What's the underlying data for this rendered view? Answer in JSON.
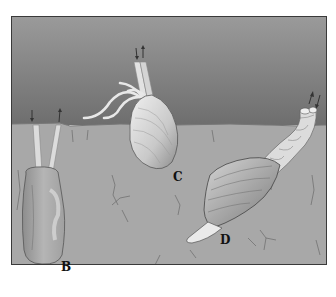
{
  "figure": {
    "colors": {
      "water_top": "#8a8a8a",
      "water_bottom": "#6f6f6f",
      "sediment": "#a9a9a9",
      "frame_border": "#3a3a3a",
      "shell_light": "#d8d8d8",
      "shell_dark": "#7a7a7a"
    },
    "labels": {
      "b": "B",
      "c": "C",
      "d": "D"
    }
  }
}
